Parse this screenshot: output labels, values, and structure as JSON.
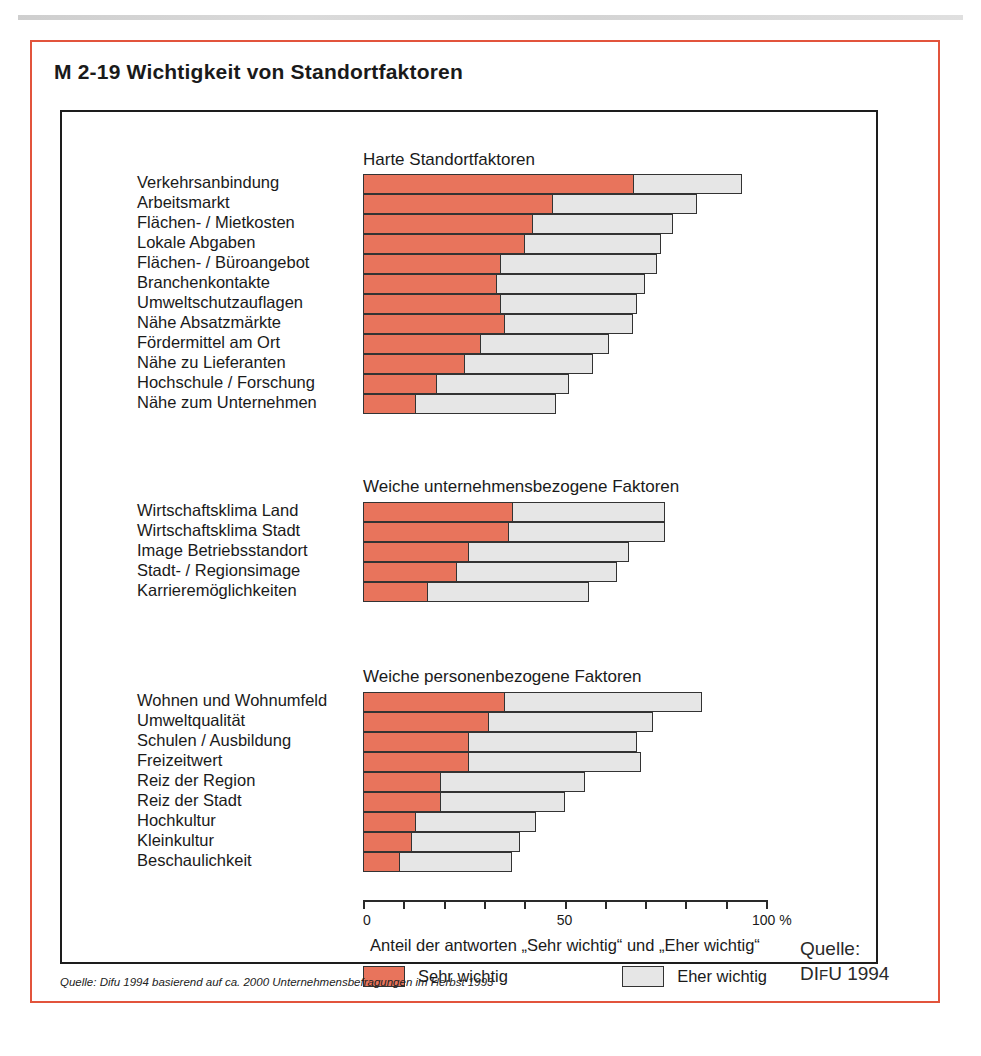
{
  "figure": {
    "title": "M 2-19 Wichtigkeit von Standortfaktoren",
    "source_note": "Quelle: Difu 1994 basierend auf ca. 2000 Unternehmensbefragungen im Herbst 1993",
    "credit_line_1": "Quelle:",
    "credit_line_2_prefix": "DI",
    "credit_line_2_smallcap": "F",
    "credit_line_2_suffix": "U 1994"
  },
  "legend": {
    "items": [
      {
        "label": "Sehr wichtig",
        "color": "#e8745c",
        "key": "sehr_wichtig"
      },
      {
        "label": "Eher wichtig",
        "color": "#e6e6e6",
        "key": "eher_wichtig"
      }
    ]
  },
  "axis": {
    "caption": "Anteil der antworten „Sehr wichtig“ und „Eher wichtig“",
    "ticks": [
      0,
      10,
      20,
      30,
      40,
      50,
      60,
      70,
      80,
      90,
      100
    ],
    "tick_labels": [
      {
        "value": 0,
        "text": "0"
      },
      {
        "value": 50,
        "text": "50"
      },
      {
        "value": 100,
        "text": "100 %"
      }
    ],
    "min": 0,
    "max": 100
  },
  "chart_data": {
    "type": "bar",
    "orientation": "horizontal",
    "stacked": true,
    "title": "M 2-19 Wichtigkeit von Standortfaktoren",
    "xlabel": "Anteil der antworten „Sehr wichtig“ und „Eher wichtig“",
    "ylabel": "",
    "xlim": [
      0,
      100
    ],
    "grid": false,
    "legend_position": "bottom",
    "series": [
      {
        "name": "Sehr wichtig",
        "color": "#e8745c"
      },
      {
        "name": "Eher wichtig",
        "color": "#e6e6e6"
      }
    ],
    "groups": [
      {
        "title": "Harte Standortfaktoren",
        "categories": [
          "Verkehrsanbindung",
          "Arbeitsmarkt",
          "Flächen- / Mietkosten",
          "Lokale Abgaben",
          "Flächen- / Büroangebot",
          "Branchenkontakte",
          "Umweltschutzauflagen",
          "Nähe Absatzmärkte",
          "Fördermittel am Ort",
          "Nähe zu Lieferanten",
          "Hochschule / Forschung",
          "Nähe zum Unternehmen"
        ],
        "sehr_wichtig": [
          67,
          47,
          42,
          40,
          34,
          33,
          34,
          35,
          29,
          25,
          18,
          13
        ],
        "eher_wichtig": [
          27,
          36,
          35,
          34,
          39,
          37,
          34,
          32,
          32,
          32,
          33,
          35
        ],
        "total": [
          94,
          83,
          77,
          74,
          73,
          70,
          68,
          67,
          61,
          57,
          51,
          48
        ]
      },
      {
        "title": "Weiche unternehmensbezogene Faktoren",
        "categories": [
          "Wirtschaftsklima Land",
          "Wirtschaftsklima Stadt",
          "Image Betriebsstandort",
          "Stadt- / Regionsimage",
          "Karrieremöglichkeiten"
        ],
        "sehr_wichtig": [
          37,
          36,
          26,
          23,
          16
        ],
        "eher_wichtig": [
          38,
          39,
          40,
          40,
          40
        ],
        "total": [
          75,
          75,
          66,
          63,
          56
        ]
      },
      {
        "title": "Weiche personenbezogene Faktoren",
        "categories": [
          "Wohnen und Wohnumfeld",
          "Umweltqualität",
          "Schulen / Ausbildung",
          "Freizeitwert",
          "Reiz der Region",
          "Reiz der Stadt",
          "Hochkultur",
          "Kleinkultur",
          "Beschaulichkeit"
        ],
        "sehr_wichtig": [
          35,
          31,
          26,
          26,
          19,
          19,
          13,
          12,
          9
        ],
        "eher_wichtig": [
          49,
          41,
          42,
          43,
          36,
          31,
          30,
          27,
          28
        ],
        "total": [
          84,
          72,
          68,
          69,
          55,
          50,
          43,
          39,
          37
        ]
      }
    ]
  }
}
